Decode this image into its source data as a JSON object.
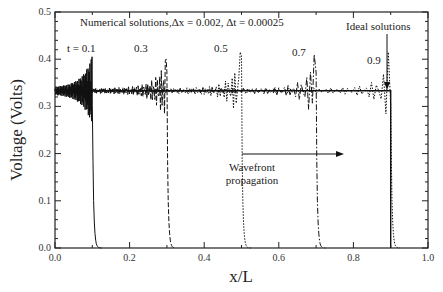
{
  "chart_data": {
    "type": "line",
    "title": "",
    "xlabel": "x/L",
    "ylabel": "Voltage (Volts)",
    "xlim": [
      0.0,
      1.0
    ],
    "ylim": [
      0.0,
      0.5
    ],
    "x_ticks": [
      "0.0",
      "0.2",
      "0.4",
      "0.6",
      "0.8",
      "1.0"
    ],
    "y_ticks": [
      "0.0",
      "0.1",
      "0.2",
      "0.3",
      "0.4",
      "0.5"
    ],
    "grid": false,
    "annotations": {
      "numerical": "Numerical solutions,Δx = 0.002, Δt = 0.00025",
      "ideal": "Ideal solutions",
      "wavefront_line1": "Wavefront",
      "wavefront_line2": "propagation",
      "time_labels": [
        "t = 0.1",
        "0.3",
        "0.5",
        "0.7",
        "0.9"
      ]
    },
    "series": [
      {
        "name": "t = 0.1",
        "style": "solid",
        "front_x": 0.1,
        "plateau": 0.333,
        "peak": 0.405
      },
      {
        "name": "t = 0.3",
        "style": "dashed",
        "front_x": 0.3,
        "plateau": 0.333,
        "peak": 0.4
      },
      {
        "name": "t = 0.5",
        "style": "dotted",
        "front_x": 0.5,
        "plateau": 0.333,
        "peak": 0.415
      },
      {
        "name": "t = 0.7",
        "style": "dash-dot",
        "front_x": 0.7,
        "plateau": 0.333,
        "peak": 0.41
      },
      {
        "name": "t = 0.9",
        "style": "dotted",
        "front_x": 0.9,
        "plateau": 0.333,
        "peak": 0.415
      },
      {
        "name": "Ideal solutions",
        "style": "solid-step",
        "front_x": 0.9,
        "plateau": 0.333
      }
    ],
    "wavefront_arrow": {
      "from_x": 0.5,
      "to_x": 0.7,
      "y": 0.18
    }
  }
}
